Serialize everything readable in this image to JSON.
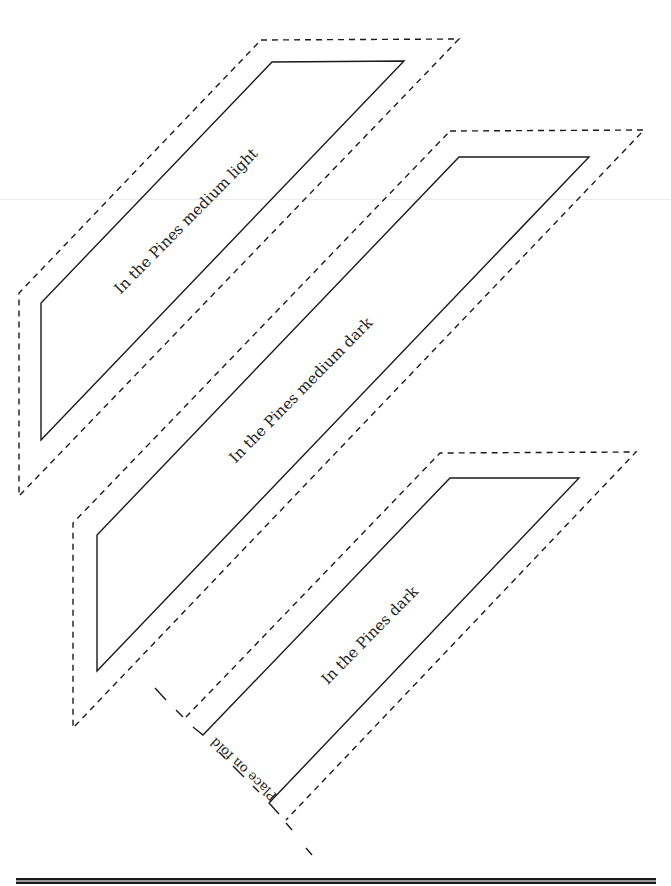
{
  "page": {
    "width": 671,
    "height": 886,
    "background": "#ffffff"
  },
  "style": {
    "stroke": "#1a1a1a",
    "dash": "6 5"
  },
  "pieces": [
    {
      "id": "medium-light",
      "label": "In the Pines medium light",
      "label_center": [
        186,
        221
      ],
      "label_angle": -45.5,
      "cut_outline_solid": [
        [
          272,
          62
        ],
        [
          404,
          61
        ],
        [
          41,
          440
        ],
        [
          41,
          303
        ]
      ],
      "seam_outline_dashed": [
        [
          261,
          40
        ],
        [
          459,
          39
        ],
        [
          19,
          496
        ],
        [
          19,
          293
        ]
      ]
    },
    {
      "id": "medium-dark",
      "label": "In the Pines medium dark",
      "label_center": [
        301,
        390
      ],
      "label_angle": -45.5,
      "cut_outline_solid": [
        [
          459,
          157
        ],
        [
          589,
          157
        ],
        [
          97,
          671
        ],
        [
          97,
          535
        ]
      ],
      "seam_outline_dashed": [
        [
          450,
          131
        ],
        [
          644,
          130
        ],
        [
          73,
          728
        ],
        [
          73,
          523
        ]
      ]
    },
    {
      "id": "dark",
      "label": "In the Pines dark",
      "label_center": [
        370,
        635
      ],
      "label_angle": -45.5,
      "cut_outline_solid_path": [
        [
          193,
          727
        ],
        [
          203,
          735
        ],
        [
          450,
          478
        ],
        [
          579,
          478
        ],
        [
          269,
          803
        ],
        [
          279,
          814
        ]
      ],
      "seam_outline_dashed_path": [
        [
          186,
          717
        ],
        [
          440,
          453
        ],
        [
          636,
          452
        ],
        [
          286,
          820
        ]
      ],
      "fold": {
        "label": "Place on fold",
        "label_center": [
          243,
          769
        ],
        "label_angle": 223,
        "dash_segments": [
          [
            [
              155,
              688
            ],
            [
              166,
              700
            ]
          ],
          [
            [
              176,
              710
            ],
            [
              183,
              717
            ]
          ],
          [
            [
              219,
              752
            ],
            [
              225,
              758
            ]
          ],
          [
            [
              233,
              766
            ],
            [
              244,
              777
            ]
          ],
          [
            [
              253,
              786
            ],
            [
              259,
              792
            ]
          ],
          [
            [
              286,
              823
            ],
            [
              292,
              830
            ]
          ],
          [
            [
              306,
              848
            ],
            [
              312,
              855
            ]
          ]
        ]
      }
    }
  ],
  "bottom_rule": {
    "y": 878
  },
  "scan_line": {
    "y": 199
  }
}
